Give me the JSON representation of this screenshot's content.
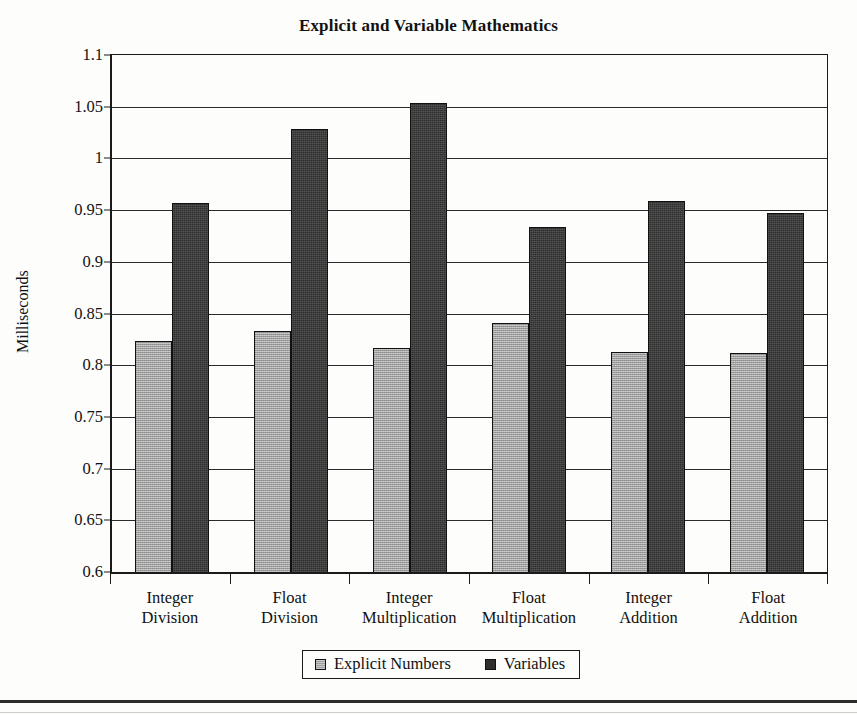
{
  "chart_data": {
    "type": "bar",
    "title": "Explicit and Variable Mathematics",
    "xlabel": "",
    "ylabel": "Milliseconds",
    "ylim": [
      0.6,
      1.1
    ],
    "ytick_step": 0.05,
    "yticks": [
      "1.1",
      "1.05",
      "1",
      "0.95",
      "0.9",
      "0.85",
      "0.8",
      "0.75",
      "0.7",
      "0.65",
      "0.6"
    ],
    "ytick_values": [
      1.1,
      1.05,
      1.0,
      0.95,
      0.9,
      0.85,
      0.8,
      0.75,
      0.7,
      0.65,
      0.6
    ],
    "grid": true,
    "legend_position": "bottom",
    "categories": [
      "Integer Division",
      "Float Division",
      "Integer Multiplication",
      "Float Multiplication",
      "Integer Addition",
      "Float Addition"
    ],
    "category_lines": [
      [
        "Integer",
        "Division"
      ],
      [
        "Float",
        "Division"
      ],
      [
        "Integer",
        "Multiplication"
      ],
      [
        "Float",
        "Multiplication"
      ],
      [
        "Integer",
        "Addition"
      ],
      [
        "Float",
        "Addition"
      ]
    ],
    "series": [
      {
        "name": "Explicit Numbers",
        "color": "#9d9d9d",
        "values": [
          0.823,
          0.833,
          0.817,
          0.841,
          0.813,
          0.812
        ]
      },
      {
        "name": "Variables",
        "color": "#2f2f2f",
        "values": [
          0.957,
          1.028,
          1.054,
          0.934,
          0.959,
          0.947
        ]
      }
    ]
  },
  "legend": {
    "entries": [
      {
        "label": "Explicit Numbers",
        "swatch": "explicit"
      },
      {
        "label": "Variables",
        "swatch": "variables"
      }
    ]
  }
}
